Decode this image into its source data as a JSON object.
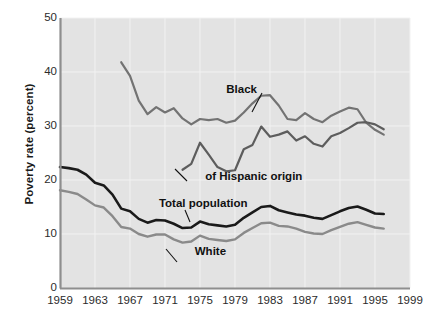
{
  "chart_data": {
    "type": "line",
    "title": "",
    "xlabel": "",
    "ylabel": "Poverty rate (percent)",
    "xlim": [
      1959,
      1999
    ],
    "ylim": [
      0,
      50
    ],
    "grid": true,
    "legend_position": "inline-annotations",
    "xticks": [
      "1959",
      "1963",
      "1967",
      "1971",
      "1975",
      "1979",
      "1983",
      "1987",
      "1991",
      "1995",
      "1999"
    ],
    "yticks": [
      "0",
      "10",
      "20",
      "30",
      "40",
      "50"
    ],
    "annotations": [
      {
        "text": "Black",
        "x": 1978.0,
        "y": 36.6
      },
      {
        "text": "of Hispanic origin",
        "x": 1975.6,
        "y": 20.6
      },
      {
        "text": "Total population",
        "x": 1970.3,
        "y": 15.6
      },
      {
        "text": "White",
        "x": 1974.4,
        "y": 6.7
      }
    ],
    "series": [
      {
        "name": "Black",
        "color": "#737373",
        "width": 2.2,
        "x": [
          1966,
          1967,
          1968,
          1969,
          1970,
          1971,
          1972,
          1973,
          1974,
          1975,
          1976,
          1977,
          1978,
          1979,
          1980,
          1981,
          1982,
          1983,
          1984,
          1985,
          1986,
          1987,
          1988,
          1989,
          1990,
          1991,
          1992,
          1993,
          1994,
          1995,
          1996
        ],
        "values": [
          41.8,
          39.3,
          34.7,
          32.2,
          33.5,
          32.5,
          33.3,
          31.4,
          30.3,
          31.3,
          31.1,
          31.3,
          30.6,
          31.0,
          32.5,
          34.2,
          35.6,
          35.7,
          33.8,
          31.3,
          31.1,
          32.4,
          31.3,
          30.7,
          31.9,
          32.7,
          33.4,
          33.1,
          30.6,
          29.3,
          28.4
        ]
      },
      {
        "name": "of Hispanic origin",
        "color": "#5d5d5d",
        "width": 2.2,
        "x": [
          1973,
          1974,
          1975,
          1976,
          1977,
          1978,
          1979,
          1980,
          1981,
          1982,
          1983,
          1984,
          1985,
          1986,
          1987,
          1988,
          1989,
          1990,
          1991,
          1992,
          1993,
          1994,
          1995,
          1996
        ],
        "values": [
          21.9,
          23.0,
          26.9,
          24.7,
          22.4,
          21.6,
          21.8,
          25.7,
          26.5,
          29.9,
          28.0,
          28.4,
          29.0,
          27.3,
          28.1,
          26.7,
          26.2,
          28.1,
          28.7,
          29.6,
          30.6,
          30.7,
          30.3,
          29.4
        ]
      },
      {
        "name": "Total population",
        "color": "#1a1a1a",
        "width": 2.6,
        "x": [
          1959,
          1960,
          1961,
          1962,
          1963,
          1964,
          1965,
          1966,
          1967,
          1968,
          1969,
          1970,
          1971,
          1972,
          1973,
          1974,
          1975,
          1976,
          1977,
          1978,
          1979,
          1980,
          1981,
          1982,
          1983,
          1984,
          1985,
          1986,
          1987,
          1988,
          1989,
          1990,
          1991,
          1992,
          1993,
          1994,
          1995,
          1996
        ],
        "values": [
          22.4,
          22.2,
          21.9,
          21.0,
          19.5,
          19.0,
          17.3,
          14.7,
          14.2,
          12.8,
          12.1,
          12.6,
          12.5,
          11.9,
          11.1,
          11.2,
          12.3,
          11.8,
          11.6,
          11.4,
          11.7,
          13.0,
          14.0,
          15.0,
          15.2,
          14.4,
          14.0,
          13.6,
          13.4,
          13.0,
          12.8,
          13.5,
          14.2,
          14.8,
          15.1,
          14.5,
          13.8,
          13.7
        ]
      },
      {
        "name": "White",
        "color": "#8a8a8a",
        "width": 2.4,
        "x": [
          1959,
          1960,
          1961,
          1962,
          1963,
          1964,
          1965,
          1966,
          1967,
          1968,
          1969,
          1970,
          1971,
          1972,
          1973,
          1974,
          1975,
          1976,
          1977,
          1978,
          1979,
          1980,
          1981,
          1982,
          1983,
          1984,
          1985,
          1986,
          1987,
          1988,
          1989,
          1990,
          1991,
          1992,
          1993,
          1994,
          1995,
          1996
        ],
        "values": [
          18.1,
          17.8,
          17.4,
          16.4,
          15.3,
          14.9,
          13.3,
          11.3,
          11.0,
          10.0,
          9.5,
          9.9,
          9.9,
          9.0,
          8.4,
          8.6,
          9.7,
          9.1,
          8.9,
          8.7,
          9.0,
          10.2,
          11.1,
          12.0,
          12.1,
          11.5,
          11.4,
          11.0,
          10.4,
          10.1,
          10.0,
          10.7,
          11.3,
          11.9,
          12.2,
          11.7,
          11.2,
          11.0
        ]
      }
    ]
  },
  "axes": {
    "ylabel": "Poverty rate (percent)"
  }
}
